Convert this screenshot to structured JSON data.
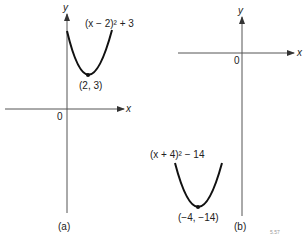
{
  "figure": {
    "panels": [
      {
        "id": "a",
        "caption": "(a)",
        "equation": "(x − 2)² + 3",
        "vertex_label": "(2, 3)",
        "origin_label": "0",
        "x_axis_label": "x",
        "y_axis_label": "y"
      },
      {
        "id": "b",
        "caption": "(b)",
        "equation": "(x + 4)² − 14",
        "vertex_label": "(−4, −14)",
        "origin_label": "0",
        "x_axis_label": "x",
        "y_axis_label": "y"
      }
    ],
    "footer_mark": "5.57"
  },
  "colors": {
    "axis": "#555555",
    "curve": "#111111",
    "text": "#222222"
  }
}
